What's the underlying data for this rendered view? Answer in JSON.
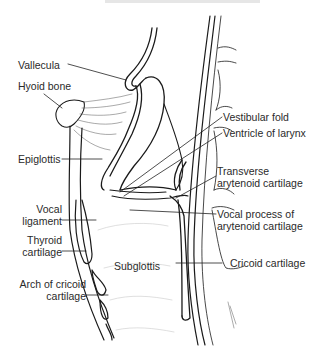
{
  "figure": {
    "labels_left": [
      {
        "id": "vallecula",
        "text": "Vallecula"
      },
      {
        "id": "hyoid-bone",
        "text": "Hyoid bone"
      },
      {
        "id": "epiglottis",
        "text": "Epiglottis"
      },
      {
        "id": "vocal-ligament",
        "lines": [
          "Vocal",
          "ligament"
        ]
      },
      {
        "id": "thyroid-cartilage",
        "lines": [
          "Thyroid",
          "cartilage"
        ]
      },
      {
        "id": "arch-of-cricoid-cartilage",
        "lines": [
          "Arch of cricoid",
          "cartilage"
        ]
      }
    ],
    "labels_center": [
      {
        "id": "subglottis",
        "text": "Subglottis"
      }
    ],
    "labels_right": [
      {
        "id": "vestibular-fold",
        "text": "Vestibular fold"
      },
      {
        "id": "ventricle-of-larynx",
        "text": "Ventricle of larynx"
      },
      {
        "id": "transverse-arytenoid-cartilage",
        "lines": [
          "Transverse",
          "arytenoid cartilage"
        ]
      },
      {
        "id": "vocal-process-of-arytenoid-cartilage",
        "lines": [
          "Vocal process of",
          "arytenoid cartilage"
        ]
      },
      {
        "id": "cricoid-cartilage",
        "text": "Cricoid cartilage"
      }
    ],
    "colors": {
      "ink": "#1a1a1a",
      "label_text": "#2a2a2a",
      "background": "#ffffff",
      "shading": "#9a9a9a"
    }
  }
}
